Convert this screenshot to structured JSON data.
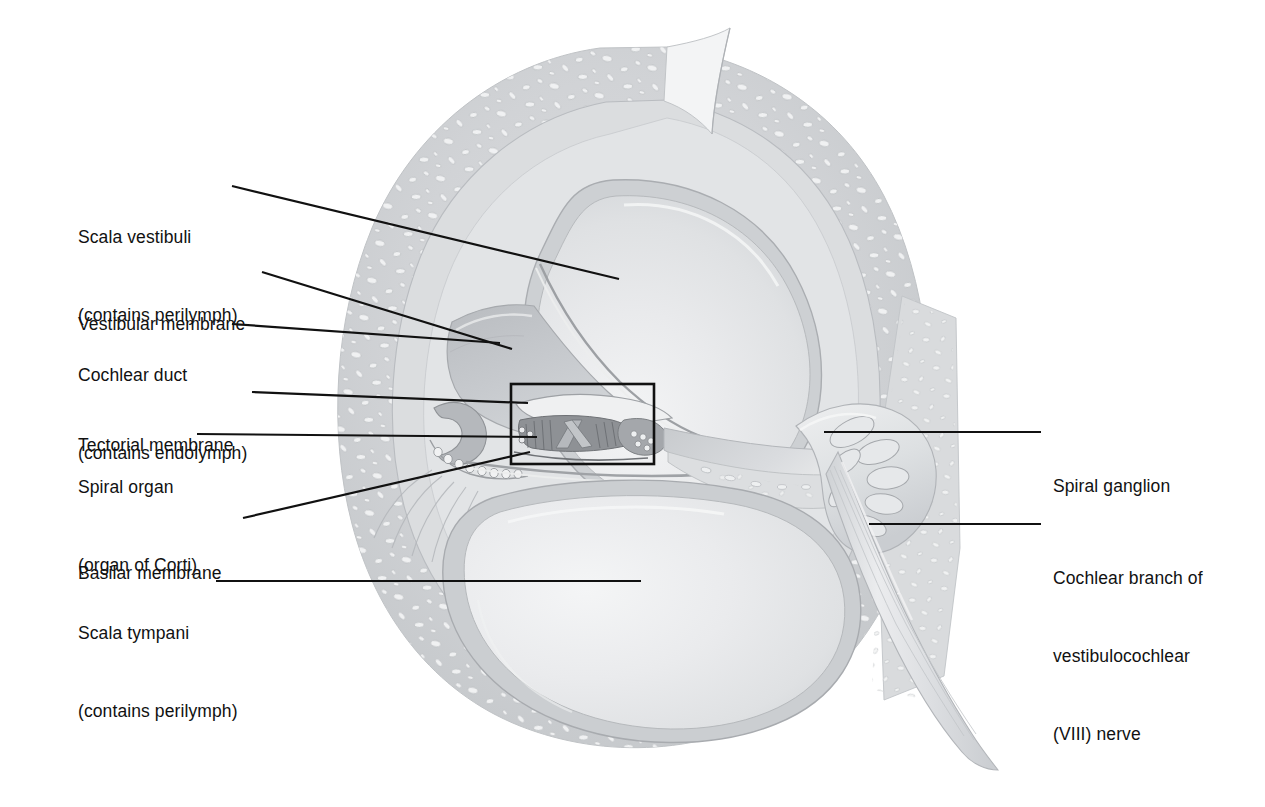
{
  "figure": {
    "background_color": "#ffffff",
    "ink_color": "#111111",
    "bone_color": "#d2d4d6",
    "lumen_color": "#e9eaec",
    "membrane_color": "#bfc2c5",
    "nerve_color": "#dcdee0"
  },
  "labels_left": [
    {
      "name": "scala-vestibuli",
      "line1": "Scala vestibuli",
      "line2": "(contains perilymph)",
      "x": 78,
      "y": 172
    },
    {
      "name": "vestibular-membrane",
      "line1": "Vestibular membrane",
      "line2": "",
      "x": 78,
      "y": 259
    },
    {
      "name": "cochlear-duct",
      "line1": "Cochlear duct",
      "line2": "(contains endolymph)",
      "x": 78,
      "y": 310
    },
    {
      "name": "tectorial-membrane",
      "line1": "Tectorial membrane",
      "line2": "",
      "x": 78,
      "y": 380
    },
    {
      "name": "spiral-organ",
      "line1": "Spiral organ",
      "line2": "(organ of Corti)",
      "x": 78,
      "y": 422
    },
    {
      "name": "basilar-membrane",
      "line1": "Basilar membrane",
      "line2": "",
      "x": 78,
      "y": 508
    },
    {
      "name": "scala-tympani",
      "line1": "Scala tympani",
      "line2": "(contains perilymph)",
      "x": 78,
      "y": 568
    }
  ],
  "labels_right": [
    {
      "name": "spiral-ganglion",
      "line1": "Spiral ganglion",
      "line2": "",
      "line3": "",
      "x": 1053,
      "y": 425
    },
    {
      "name": "cochlear-branch-nerve",
      "line1": "Cochlear branch of",
      "line2": "vestibulocochlear",
      "line3": "(VIII) nerve",
      "x": 1053,
      "y": 517
    }
  ],
  "leaders": [
    {
      "name": "leader-scala-vestibuli",
      "points": "232,186 619,279"
    },
    {
      "name": "leader-vestibular-membrane",
      "points": "262,272 512,349"
    },
    {
      "name": "leader-cochlear-duct",
      "points": "232,324 500,343"
    },
    {
      "name": "leader-tectorial-membrane",
      "points": "252,392 528,403"
    },
    {
      "name": "leader-spiral-organ",
      "points": "197,434 537,437"
    },
    {
      "name": "leader-basilar-membrane",
      "points": "243,518 530,452"
    },
    {
      "name": "leader-scala-tympani",
      "points": "216,581 641,581"
    },
    {
      "name": "leader-spiral-ganglion",
      "points": "1041,432 824,432"
    },
    {
      "name": "leader-cochlear-branch",
      "points": "1041,524 869,524"
    }
  ],
  "detail_box": {
    "name": "organ-of-corti-detail-box",
    "x": 511,
    "y": 384,
    "w": 143,
    "h": 80
  }
}
